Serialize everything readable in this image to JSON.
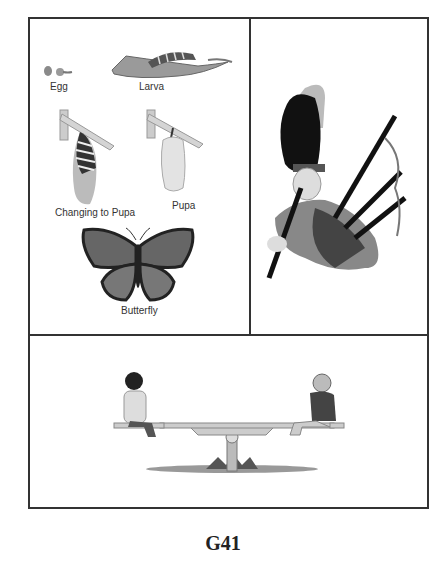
{
  "page": {
    "code": "G41"
  },
  "panels": {
    "life_cycle": {
      "labels": {
        "egg": "Egg",
        "larva": "Larva",
        "changing": "Changing to Pupa",
        "pupa": "Pupa",
        "butterfly": "Butterfly"
      }
    },
    "bagpiper": {},
    "seesaw": {}
  },
  "colors": {
    "border": "#333333",
    "ink": "#222222",
    "paper": "#ffffff"
  }
}
